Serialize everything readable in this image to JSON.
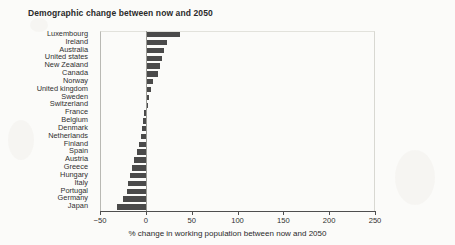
{
  "chart_data": {
    "type": "bar",
    "orientation": "horizontal",
    "title": "Demographic change between now and 2050",
    "xlabel": "% change in working population between now and 2050",
    "ylabel": "",
    "xlim": [
      -50,
      250
    ],
    "xticks": [
      -50,
      0,
      50,
      100,
      150,
      200,
      250
    ],
    "xtick_labels": [
      "−50",
      "0",
      "50",
      "100",
      "150",
      "200",
      "250"
    ],
    "grid": false,
    "legend": false,
    "bar_color": "#4a4a4a",
    "categories": [
      "Luxembourg",
      "Ireland",
      "Australia",
      "United states",
      "New Zealand",
      "Canada",
      "Norway",
      "United kingdom",
      "Sweden",
      "Switzerland",
      "France",
      "Belgium",
      "Denmark",
      "Netherlands",
      "Finland",
      "Spain",
      "Austria",
      "Greece",
      "Hungary",
      "Italy",
      "Portugal",
      "Germany",
      "Japan"
    ],
    "values": [
      37,
      23,
      20,
      18,
      16,
      13,
      8,
      6,
      4,
      2,
      -2,
      -3,
      -4,
      -5,
      -8,
      -10,
      -13,
      -15,
      -17,
      -19,
      -21,
      -25,
      -32
    ]
  }
}
